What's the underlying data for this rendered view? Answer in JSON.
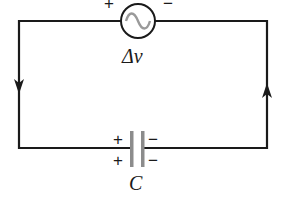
{
  "diagram": {
    "type": "RC-less AC circuit with capacitor",
    "source": {
      "label": "Δv",
      "symbol": "ac-source",
      "plus_sign": "+",
      "minus_sign": "−"
    },
    "capacitor": {
      "label": "C",
      "plus_sign": "+",
      "minus_sign": "−"
    },
    "current_direction": {
      "left_wire": "down",
      "right_wire": "up"
    },
    "colors": {
      "wire": "#1a1a1a",
      "capacitor_plate": "#8c8c8c",
      "sine_wave": "#9a9a9a"
    }
  }
}
